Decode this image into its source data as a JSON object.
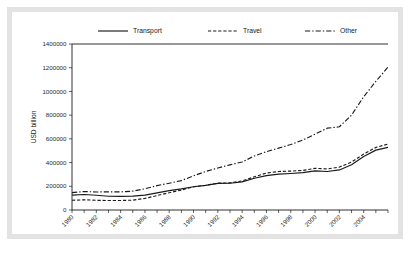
{
  "chart_data": {
    "type": "line",
    "title": "",
    "xlabel": "",
    "ylabel": "USD billion",
    "ylim": [
      0,
      1400000
    ],
    "xlim": [
      1980,
      2006
    ],
    "grid": false,
    "legend_position": "top",
    "ytick_labels": [
      "0",
      "200000",
      "400000",
      "600000",
      "800000",
      "1000000",
      "1200000",
      "1400000"
    ],
    "ytick_values": [
      0,
      200000,
      400000,
      600000,
      800000,
      1000000,
      1200000,
      1400000
    ],
    "xtick_labels": [
      "1980",
      "1982",
      "1984",
      "1986",
      "1988",
      "1990",
      "1992",
      "1994",
      "1996",
      "1998",
      "2000",
      "2002",
      "2004"
    ],
    "xtick_values": [
      1980,
      1982,
      1984,
      1986,
      1988,
      1990,
      1992,
      1994,
      1996,
      1998,
      2000,
      2002,
      2004
    ],
    "x": [
      1980,
      1981,
      1982,
      1983,
      1984,
      1985,
      1986,
      1987,
      1988,
      1989,
      1990,
      1991,
      1992,
      1993,
      1994,
      1995,
      1996,
      1997,
      1998,
      1999,
      2000,
      2001,
      2002,
      2003,
      2004,
      2005,
      2006
    ],
    "series": [
      {
        "name": "Transport",
        "style": "solid",
        "values": [
          126000,
          131000,
          124000,
          116000,
          115000,
          117000,
          126000,
          145000,
          163000,
          178000,
          196000,
          208000,
          224000,
          226000,
          237000,
          268000,
          290000,
          302000,
          308000,
          315000,
          330000,
          325000,
          338000,
          382000,
          452000,
          505000,
          528000
        ]
      },
      {
        "name": "Travel",
        "style": "dashed",
        "values": [
          82000,
          86000,
          82000,
          80000,
          80000,
          83000,
          98000,
          122000,
          146000,
          168000,
          196000,
          209000,
          226000,
          229000,
          245000,
          280000,
          312000,
          325000,
          328000,
          334000,
          351000,
          346000,
          362000,
          404000,
          472000,
          528000,
          556000
        ]
      },
      {
        "name": "Other",
        "style": "dash-dot",
        "values": [
          146000,
          156000,
          152000,
          153000,
          153000,
          159000,
          179000,
          206000,
          226000,
          248000,
          288000,
          325000,
          354000,
          381000,
          405000,
          455000,
          492000,
          522000,
          552000,
          590000,
          640000,
          690000,
          702000,
          800000,
          955000,
          1085000,
          1205000
        ]
      }
    ]
  },
  "legend": {
    "entries": [
      {
        "label": "Transport"
      },
      {
        "label": "Travel"
      },
      {
        "label": "Other"
      }
    ]
  },
  "colors": {
    "series": "#1a1a1a",
    "frame": "#e3e3e3",
    "background": "#ffffff",
    "axis": "#1a1a1a"
  }
}
